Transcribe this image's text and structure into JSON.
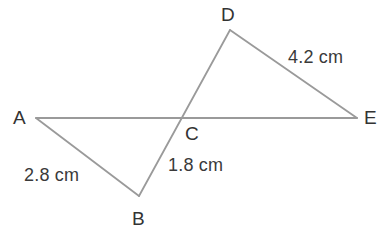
{
  "figure": {
    "width": 390,
    "height": 237,
    "background_color": "#ffffff",
    "stroke_color": "#9a9a9a",
    "stroke_width": 1.8,
    "text_color": "#333333"
  },
  "vertices": [
    {
      "id": "A",
      "label": "A",
      "x": 36,
      "y": 118,
      "label_x": 13,
      "label_y": 108
    },
    {
      "id": "B",
      "label": "B",
      "x": 139,
      "y": 196,
      "label_x": 132,
      "label_y": 209
    },
    {
      "id": "C",
      "label": "C",
      "x": 184,
      "y": 118,
      "label_x": 185,
      "label_y": 124
    },
    {
      "id": "D",
      "label": "D",
      "x": 230,
      "y": 30,
      "label_x": 221,
      "label_y": 5
    },
    {
      "id": "E",
      "label": "E",
      "x": 357,
      "y": 118,
      "label_x": 364,
      "label_y": 108
    }
  ],
  "segments": [
    {
      "id": "AE",
      "from": "A",
      "to": "E",
      "description": "straight line from A through C to E"
    },
    {
      "id": "BD",
      "from": "B",
      "to": "D",
      "description": "straight line from B through C to D"
    },
    {
      "id": "AB",
      "from": "A",
      "to": "B",
      "description": "side of triangle ABC"
    },
    {
      "id": "DE",
      "from": "D",
      "to": "E",
      "description": "side of triangle CDE"
    }
  ],
  "measurements": [
    {
      "id": "AB-length",
      "text": "2.8 cm",
      "for_segment": "AB",
      "x": 24,
      "y": 166
    },
    {
      "id": "BC-length",
      "text": "1.8 cm",
      "for_segment": "BC",
      "x": 168,
      "y": 156
    },
    {
      "id": "DE-length",
      "text": "4.2 cm",
      "for_segment": "DE",
      "x": 288,
      "y": 48
    }
  ]
}
